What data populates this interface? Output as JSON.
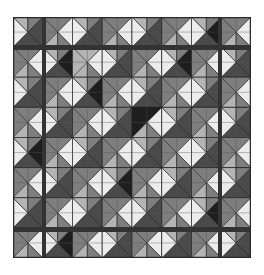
{
  "image": {
    "subject": "grayscale patchwork quilt with diamond pattern",
    "quilt_bounds": {
      "x": 13,
      "y": 17,
      "w": 238,
      "h": 241
    },
    "grid": {
      "cols": 8,
      "rows": 8
    },
    "colors": {
      "border": "#2a2a2a",
      "black": "#1e1e1e",
      "dark": "#4a4a4a",
      "mid": "#7e7e7e",
      "light": "#b4b4b4",
      "white": "#ececec",
      "sashing": "#333333"
    },
    "sashing": {
      "horizontal_y": [
        48,
        230
      ],
      "vertical_x": [
        44,
        220
      ]
    },
    "blocks": [
      [
        "A",
        "B",
        "A",
        "B",
        "A",
        "B",
        "A",
        "B"
      ],
      [
        "C",
        "D",
        "C",
        "D",
        "C",
        "D",
        "C",
        "D"
      ],
      [
        "A",
        "B",
        "A",
        "B",
        "A",
        "B",
        "A",
        "B"
      ],
      [
        "C",
        "D",
        "C",
        "D",
        "C",
        "D",
        "C",
        "D"
      ],
      [
        "A",
        "B",
        "A",
        "B",
        "A",
        "B",
        "A",
        "B"
      ],
      [
        "C",
        "D",
        "C",
        "D",
        "C",
        "D",
        "C",
        "D"
      ],
      [
        "A",
        "B",
        "A",
        "B",
        "A",
        "B",
        "A",
        "B"
      ],
      [
        "C",
        "D",
        "C",
        "D",
        "C",
        "D",
        "C",
        "D"
      ]
    ],
    "block_tones": [
      [
        "dark",
        "mid",
        "dark",
        "mid",
        "dark",
        "mid",
        "black",
        "mid"
      ],
      [
        "mid",
        "black",
        "light",
        "dark",
        "mid",
        "black",
        "mid",
        "dark"
      ],
      [
        "dark",
        "mid",
        "black",
        "mid",
        "dark",
        "mid",
        "dark",
        "mid"
      ],
      [
        "mid",
        "dark",
        "mid",
        "dark",
        "black",
        "dark",
        "mid",
        "dark"
      ],
      [
        "black",
        "mid",
        "dark",
        "mid",
        "dark",
        "mid",
        "dark",
        "mid"
      ],
      [
        "mid",
        "dark",
        "mid",
        "black",
        "mid",
        "dark",
        "mid",
        "dark"
      ],
      [
        "dark",
        "mid",
        "dark",
        "mid",
        "dark",
        "mid",
        "black",
        "mid"
      ],
      [
        "mid",
        "black",
        "mid",
        "dark",
        "mid",
        "dark",
        "mid",
        "dark"
      ]
    ]
  }
}
